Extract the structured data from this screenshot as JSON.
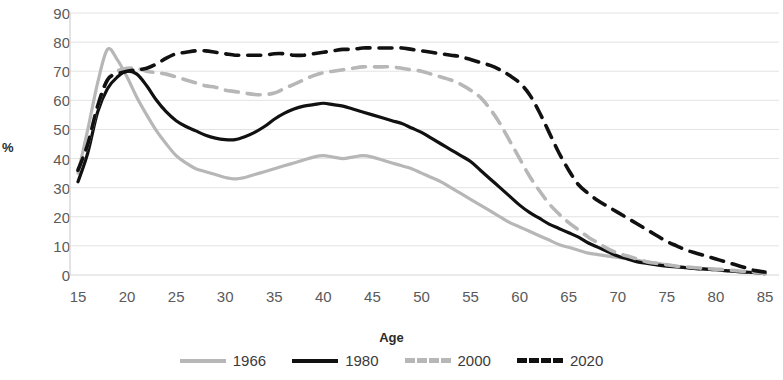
{
  "chart_data": {
    "type": "line",
    "title": "",
    "xlabel": "Age",
    "ylabel": "%",
    "xlim": [
      15,
      85
    ],
    "ylim": [
      0,
      90
    ],
    "grid": true,
    "legend_position": "bottom",
    "x": [
      15,
      16,
      17,
      18,
      19,
      20,
      21,
      22,
      23,
      24,
      25,
      26,
      27,
      28,
      29,
      30,
      31,
      32,
      33,
      34,
      35,
      36,
      37,
      38,
      39,
      40,
      41,
      42,
      43,
      44,
      45,
      46,
      47,
      48,
      49,
      50,
      51,
      52,
      53,
      54,
      55,
      56,
      57,
      58,
      59,
      60,
      61,
      62,
      63,
      64,
      65,
      66,
      67,
      68,
      69,
      70,
      71,
      72,
      73,
      74,
      75,
      76,
      77,
      78,
      79,
      80,
      81,
      82,
      83,
      84,
      85
    ],
    "xticks": [
      15,
      20,
      25,
      30,
      35,
      40,
      45,
      50,
      55,
      60,
      65,
      70,
      75,
      80,
      85
    ],
    "yticks": [
      0,
      10,
      20,
      30,
      40,
      50,
      60,
      70,
      80,
      90
    ],
    "series": [
      {
        "name": "1966",
        "color": "#b7b7b7",
        "dash": "solid",
        "values": [
          35,
          50,
          66,
          77.5,
          74,
          68,
          61,
          55,
          49.5,
          45,
          41,
          38.5,
          36.5,
          35.5,
          34.5,
          33.5,
          33,
          33.5,
          34.5,
          35.5,
          36.5,
          37.5,
          38.5,
          39.5,
          40.5,
          41,
          40.5,
          40,
          40.5,
          41,
          40.5,
          39.5,
          38.5,
          37.5,
          36.5,
          35,
          33.5,
          32,
          30,
          28,
          26,
          24,
          22,
          20,
          18,
          16.5,
          15,
          13.5,
          12,
          10.5,
          9.5,
          8.5,
          7.5,
          7,
          6.5,
          6,
          5.5,
          5,
          4.5,
          4,
          3.5,
          3,
          2.5,
          2.2,
          2,
          1.8,
          1.5,
          1.2,
          1,
          0.8,
          0.5
        ]
      },
      {
        "name": "1980",
        "color": "#111111",
        "dash": "solid",
        "values": [
          32,
          42,
          56,
          64,
          68,
          70,
          69,
          65,
          60,
          56,
          53,
          51,
          49.5,
          48,
          47,
          46.5,
          46.5,
          47.5,
          49,
          51,
          53.5,
          55.5,
          57,
          58,
          58.5,
          59,
          58.5,
          58,
          57,
          56,
          55,
          54,
          53,
          52,
          50.5,
          49,
          47,
          45,
          43,
          41,
          39,
          36,
          33,
          30,
          27,
          24,
          21.5,
          19.5,
          17.5,
          16,
          14.5,
          13,
          11,
          9.5,
          8,
          6.5,
          5.5,
          4.5,
          4,
          3.5,
          3,
          2.8,
          2.5,
          2.2,
          2,
          1.8,
          1.5,
          1.2,
          1,
          0.8,
          0.5
        ]
      },
      {
        "name": "2000",
        "color": "#b7b7b7",
        "dash": "dashed",
        "values": [
          36,
          45,
          58,
          67,
          70,
          71,
          71,
          70,
          69.5,
          69,
          68,
          67,
          66,
          65,
          64.5,
          63.5,
          63,
          62.5,
          62,
          62,
          62.5,
          64,
          65.5,
          67,
          68.5,
          69.5,
          70,
          70.5,
          71,
          71.5,
          71.5,
          71.5,
          71.5,
          71,
          70.5,
          70,
          69,
          68,
          67,
          65.5,
          63.5,
          61,
          57,
          52,
          46,
          40,
          34,
          29,
          24.5,
          21,
          18,
          15.5,
          13,
          11,
          9,
          7.5,
          6.5,
          5.5,
          4.5,
          4,
          3.5,
          3,
          2.8,
          2.5,
          2.2,
          2,
          1.8,
          1.5,
          1.2,
          1,
          0.5
        ]
      },
      {
        "name": "2020",
        "color": "#111111",
        "dash": "dashed",
        "values": [
          36,
          45,
          58,
          67,
          69,
          70,
          70.5,
          71,
          72.5,
          74.5,
          76,
          76.5,
          77,
          77,
          76.5,
          76,
          75.5,
          75.5,
          75.5,
          75.5,
          76,
          76,
          75.5,
          75.5,
          76,
          76.5,
          77,
          77.5,
          77.5,
          78,
          78,
          78,
          78,
          78,
          77.5,
          77,
          76.5,
          76,
          75.5,
          75,
          74,
          73,
          72,
          70.5,
          68.5,
          66,
          62,
          56,
          49,
          42,
          36,
          31,
          28,
          25.5,
          23.5,
          21.5,
          19.5,
          17.5,
          15.5,
          13.5,
          11.5,
          10,
          8.5,
          7.5,
          6.5,
          5.5,
          4.5,
          3.5,
          2.5,
          1.5,
          1
        ]
      }
    ]
  },
  "legend": {
    "items": [
      {
        "label": "1966",
        "color": "#b7b7b7",
        "dash": "solid"
      },
      {
        "label": "1980",
        "color": "#111111",
        "dash": "solid"
      },
      {
        "label": "2000",
        "color": "#b7b7b7",
        "dash": "dashed"
      },
      {
        "label": "2020",
        "color": "#111111",
        "dash": "dashed"
      }
    ]
  },
  "axis": {
    "y_title": "%",
    "x_title": "Age"
  }
}
